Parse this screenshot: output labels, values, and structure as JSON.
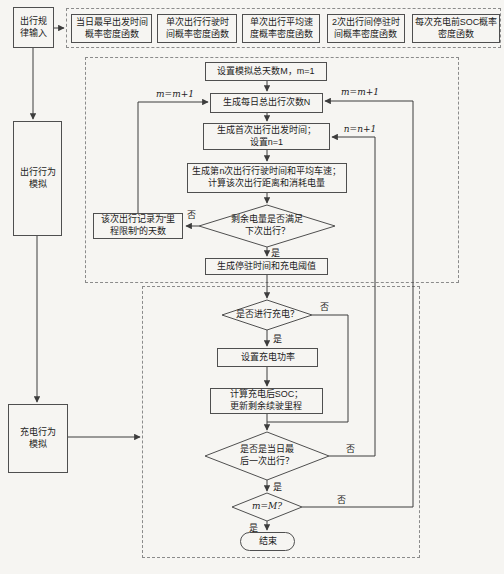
{
  "left": {
    "input": "出行规\n律输入",
    "travel_sim": "出行行为\n模拟",
    "charge_sim": "充电行为\n模拟"
  },
  "pdf_row": {
    "boxes": [
      "当日最早出发时间\n概率密度函数",
      "单次出行行驶时\n间概率密度函数",
      "单次出行平均速\n度概率密度函数",
      "2次出行间停驻时\n间概率密度函数",
      "每次充电前SOC概率\n密度函数"
    ]
  },
  "travel_flow": {
    "set_days": "设置模拟总天数M，m=1",
    "gen_trips": "生成每日总出行次数N",
    "gen_first": "生成首次出行出发时间；\n设置n=1",
    "gen_nth": "生成第n次出行行驶时间和平均车速；\n计算该次出行距离和消耗电量",
    "soc_check": "剩余电量是否满足\n下次出行？",
    "range_limited": "该次出行记录为“里\n程限制”的天数",
    "gen_park": "生成停驻时间和充电阈值"
  },
  "charge_flow": {
    "charge_check": "是否进行充电？",
    "set_power": "设置充电功率",
    "calc_soc": "计算充电后SOC；\n更新剩余续驶里程",
    "last_trip_check": "是否是当日最\n后一次出行？",
    "day_check": "m=M?",
    "end": "结束"
  },
  "labels": {
    "m_inc_left": "m=m+1",
    "m_inc_right": "m=m+1",
    "n_inc": "n=n+1",
    "yes": "是",
    "no": "否"
  },
  "colors": {
    "line": "#3d3d3d",
    "box_border": "#4f4f4f",
    "dashed_border": "#8b8b8b",
    "text": "#1c1c1c",
    "background": "#f6f5f2"
  }
}
